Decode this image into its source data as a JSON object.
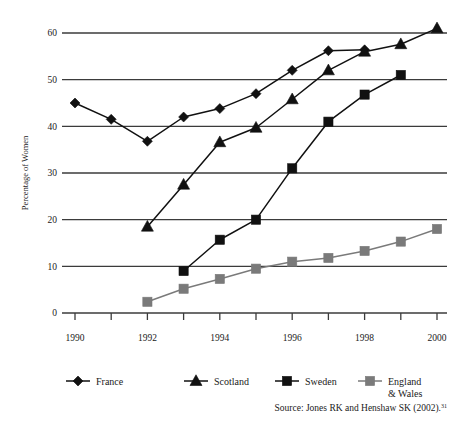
{
  "chart_data": {
    "type": "line",
    "title": "",
    "subtitle": "",
    "xlabel": "",
    "ylabel": "Percentage of Women",
    "x": [
      1990,
      1991,
      1992,
      1993,
      1994,
      1995,
      1996,
      1997,
      1998,
      1999,
      2000
    ],
    "xtick_labels": [
      "1990",
      "",
      "1992",
      "",
      "1994",
      "",
      "1996",
      "",
      "1998",
      "",
      "2000"
    ],
    "xtick_labels_visible": [
      "1990",
      "1992",
      "1994",
      "1996",
      "1998",
      "2000"
    ],
    "ytick_labels": [
      "0",
      "10",
      "20",
      "30",
      "40",
      "50",
      "60"
    ],
    "yticks": [
      0,
      10,
      20,
      30,
      40,
      50,
      60
    ],
    "xlim": [
      1990,
      2000
    ],
    "ylim": [
      0,
      60
    ],
    "grid": "horizontal",
    "legend_position": "bottom",
    "series": [
      {
        "name": "France",
        "marker": "diamond",
        "color": "#111111",
        "x": [
          1990,
          1991,
          1992,
          1993,
          1994,
          1995,
          1996,
          1997,
          1998
        ],
        "values": [
          45.0,
          41.5,
          36.8,
          42.0,
          43.8,
          47.0,
          52.0,
          56.2,
          56.4
        ]
      },
      {
        "name": "Scotland",
        "marker": "triangle",
        "color": "#111111",
        "x": [
          1992,
          1993,
          1994,
          1995,
          1996,
          1997,
          1998,
          1999,
          2000
        ],
        "values": [
          18.5,
          27.5,
          36.6,
          39.7,
          45.8,
          52.0,
          56.0,
          57.6,
          61.0
        ]
      },
      {
        "name": "Sweden",
        "marker": "square",
        "color": "#111111",
        "x": [
          1993,
          1994,
          1995,
          1996,
          1997,
          1998,
          1999
        ],
        "values": [
          9.0,
          15.7,
          20.0,
          31.0,
          41.0,
          46.8,
          51.0
        ]
      },
      {
        "name": "England\n& Wales",
        "marker": "square",
        "color": "#7a7a7a",
        "x": [
          1992,
          1993,
          1994,
          1995,
          1996,
          1997,
          1998,
          1999,
          2000
        ],
        "values": [
          2.4,
          5.2,
          7.3,
          9.5,
          11.0,
          11.8,
          13.3,
          15.3,
          18.0
        ]
      }
    ]
  },
  "legend": {
    "items": [
      {
        "label": "France",
        "marker": "diamond",
        "color": "#111111"
      },
      {
        "label": "Scotland",
        "marker": "triangle",
        "color": "#111111"
      },
      {
        "label": "Sweden",
        "marker": "square",
        "color": "#111111"
      },
      {
        "label_line1": "England",
        "label_line2": "& Wales",
        "marker": "square",
        "color": "#7a7a7a"
      }
    ]
  },
  "source": {
    "text": "Source: Jones RK and Henshaw SK (2002).",
    "superscript": "31"
  },
  "colors": {
    "dark_series": "#111111",
    "gray_series": "#7a7a7a",
    "axis": "#3b3b3b",
    "text": "#1a1a1a",
    "background": "#ffffff"
  }
}
